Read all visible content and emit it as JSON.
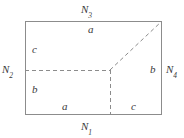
{
  "figure": {
    "type": "geometric-diagram",
    "colors": {
      "background": "#ffffff",
      "border": "#8c8c8c",
      "dashed": "#8c8c8c",
      "text": "#3a3a3a"
    },
    "rectangle": {
      "x": 25,
      "y": 21,
      "width": 137,
      "height": 94
    },
    "junction": {
      "x": 110,
      "y": 70
    },
    "dashed_segments": [
      {
        "name": "horizontal",
        "x1": 25,
        "y1": 70,
        "x2": 110,
        "y2": 70
      },
      {
        "name": "vertical",
        "x1": 110,
        "y1": 70,
        "x2": 110,
        "y2": 115
      },
      {
        "name": "diagonal",
        "x1": 110,
        "y1": 70,
        "x2": 162,
        "y2": 21
      }
    ],
    "node_labels": {
      "top": {
        "base": "N",
        "sub": "3"
      },
      "bottom": {
        "base": "N",
        "sub": "1"
      },
      "left": {
        "base": "N",
        "sub": "2"
      },
      "right": {
        "base": "N",
        "sub": "4"
      }
    },
    "region_labels": {
      "top_inside": "a",
      "upper_left": "c",
      "lower_left": "b",
      "bottom_left": "a",
      "bottom_right": "c",
      "right_inside": "b"
    }
  }
}
